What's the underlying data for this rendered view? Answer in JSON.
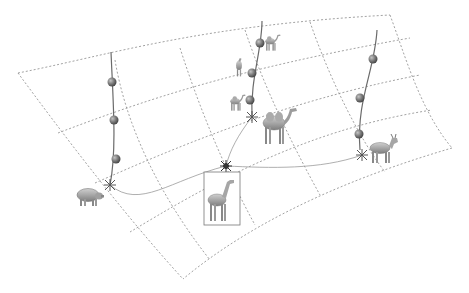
{
  "figure": {
    "title": "",
    "colors": {
      "grid": "#8a8a8a",
      "path": "#6a6a6a",
      "node": "#7a7a7a",
      "node_highlight": "#b5b5b5",
      "animal": "#9a9a9a",
      "frame": "#777777"
    }
  },
  "manifold": {
    "corners": {
      "top_left": [
        18,
        73
      ],
      "top_right": [
        390,
        15
      ],
      "bottom_right": [
        452,
        148
      ],
      "bottom": [
        183,
        279
      ]
    }
  },
  "paths": [
    {
      "name": "pig-path",
      "origin": "pig",
      "nodes": [
        [
          112,
          82
        ],
        [
          114,
          120
        ],
        [
          116,
          159
        ]
      ],
      "root": [
        110,
        185
      ]
    },
    {
      "name": "camel-path",
      "origin": "camel",
      "nodes": [
        [
          260,
          43
        ],
        [
          252,
          73
        ],
        [
          250,
          100
        ]
      ],
      "root": [
        252,
        117
      ]
    },
    {
      "name": "goat-path",
      "origin": "goat",
      "nodes": [
        [
          373,
          59
        ],
        [
          360,
          98
        ],
        [
          359,
          134
        ]
      ],
      "root": [
        362,
        155
      ]
    }
  ],
  "animals": [
    {
      "name": "pig",
      "x": 88,
      "y": 195,
      "scale": 1.0
    },
    {
      "name": "camel-large",
      "x": 278,
      "y": 127,
      "scale": 1.0
    },
    {
      "name": "camel-small-1",
      "x": 272,
      "y": 43,
      "scale": 0.45
    },
    {
      "name": "camel-small-2",
      "x": 240,
      "y": 67,
      "scale": 0.4
    },
    {
      "name": "camel-small-3",
      "x": 237,
      "y": 102,
      "scale": 0.45
    },
    {
      "name": "goat",
      "x": 382,
      "y": 150,
      "scale": 1.0
    },
    {
      "name": "giraffe",
      "x": 219,
      "y": 200,
      "scale": 1.0
    }
  ],
  "mean_shape": {
    "label": "",
    "junction": [
      226,
      166
    ],
    "frame": [
      204,
      172,
      36,
      53
    ]
  }
}
